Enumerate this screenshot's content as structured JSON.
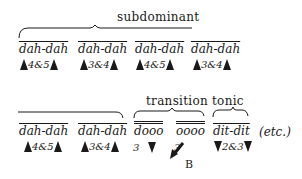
{
  "sections": {
    "subdominant": "subdominant",
    "transition": "transition",
    "tonic": "tonic"
  },
  "row1": {
    "groups": [
      {
        "syllables": "dah-dah",
        "beats": "4&5"
      },
      {
        "syllables": "dah-dah",
        "beats": "3&4"
      },
      {
        "syllables": "dah-dah",
        "beats": "4&5"
      },
      {
        "syllables": "dah-dah",
        "beats": "3&4"
      }
    ]
  },
  "row2": {
    "groups": [
      {
        "syllables": "dah-dah",
        "beats": "4&5"
      },
      {
        "syllables": "dah-dah",
        "beats": "3&4"
      }
    ],
    "transition": [
      {
        "syllables": "dooo",
        "beat": "3"
      },
      {
        "syllables": "oooo",
        "beat": "3"
      }
    ],
    "tonic": {
      "syllables": "dit-dit",
      "beats": "2&3"
    },
    "etc": "(etc.)",
    "arrow_label": "B"
  }
}
